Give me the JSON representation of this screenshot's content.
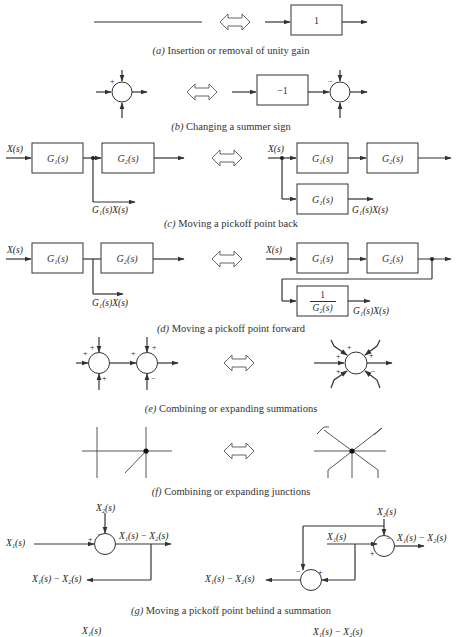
{
  "figure": {
    "sections": [
      {
        "id": "a",
        "letter": "(a)",
        "caption": "Insertion or removal of unity gain",
        "block_label": "1"
      },
      {
        "id": "b",
        "letter": "(b)",
        "caption": "Changing a summer sign",
        "block_label": "−1",
        "left_sign": "+",
        "right_sign": "−"
      },
      {
        "id": "c",
        "letter": "(c)",
        "caption": "Moving a pickoff point back",
        "input": "X(s)",
        "g1": "G₁(s)",
        "g2": "G₂(s)",
        "pickoff_out": "G₁(s)X(s)"
      },
      {
        "id": "d",
        "letter": "(d)",
        "caption": "Moving a pickoff point forward",
        "input": "X(s)",
        "g1": "G₁(s)",
        "g2": "G₂(s)",
        "pickoff_out": "G₁(s)X(s)",
        "inverse_num": "1",
        "inverse_den": "G₂(s)"
      },
      {
        "id": "e",
        "letter": "(e)",
        "caption": "Combining or expanding summations",
        "signs_left": [
          "+",
          "+",
          "+",
          "+",
          "+",
          "−"
        ],
        "signs_right": [
          "+",
          "+",
          "+",
          "+",
          "+",
          "−"
        ]
      },
      {
        "id": "f",
        "letter": "(f)",
        "caption": "Combining or expanding junctions"
      },
      {
        "id": "g",
        "letter": "(g)",
        "caption": "Moving a pickoff point behind a summation",
        "x1": "X₁(s)",
        "x2": "X₂(s)",
        "diff": "X₁(s) − X₂(s)",
        "plus": "+",
        "minus": "−"
      },
      {
        "id": "h",
        "partial_labels": {
          "left": "X₁(s)",
          "right": "X₁(s) − X₂(s)"
        }
      }
    ],
    "equivalence_symbol": "⟺"
  }
}
